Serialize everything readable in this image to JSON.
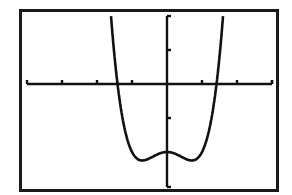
{
  "screen": {
    "description": "Graphing calculator window plot",
    "frame_color": "#1a1a1a",
    "curve_color": "#111111",
    "axis_color": "#111111",
    "background": "#ffffff"
  },
  "chart_data": {
    "type": "line",
    "title": "",
    "xlabel": "",
    "ylabel": "",
    "function_estimate": "y = x^4 - x^2 - 2",
    "xlim": [
      -4,
      3
    ],
    "ylim": [
      -3,
      2
    ],
    "xscale_ticks": [
      -3,
      -2,
      -1,
      1,
      2,
      3
    ],
    "yscale_ticks": [
      -1,
      1
    ],
    "grid": false,
    "legend": null,
    "key_points": {
      "x_intercepts": [
        -1.41,
        1.41
      ],
      "local_max": [
        0,
        -2
      ],
      "local_min": [
        [
          -0.71,
          -2.25
        ],
        [
          0.71,
          -2.25
        ]
      ]
    },
    "series": [
      {
        "name": "f(x)",
        "x": [
          -1.65,
          -1.6,
          -1.5,
          -1.4,
          -1.3,
          -1.2,
          -1.1,
          -1.0,
          -0.9,
          -0.8,
          -0.71,
          -0.6,
          -0.5,
          -0.4,
          -0.3,
          -0.2,
          -0.1,
          0,
          0.1,
          0.2,
          0.3,
          0.4,
          0.5,
          0.6,
          0.71,
          0.8,
          0.9,
          1.0,
          1.1,
          1.2,
          1.3,
          1.4,
          1.5,
          1.6,
          1.65
        ],
        "values": [
          2.69,
          1.99,
          0.81,
          -0.08,
          -0.83,
          -1.37,
          -1.75,
          -2.0,
          -2.15,
          -2.23,
          -2.25,
          -2.23,
          -2.19,
          -2.13,
          -2.08,
          -2.04,
          -2.01,
          -2.0,
          -2.01,
          -2.04,
          -2.08,
          -2.13,
          -2.19,
          -2.23,
          -2.25,
          -2.23,
          -2.15,
          -2.0,
          -1.75,
          -1.37,
          -0.83,
          -0.08,
          0.81,
          1.99,
          2.69
        ]
      }
    ]
  }
}
